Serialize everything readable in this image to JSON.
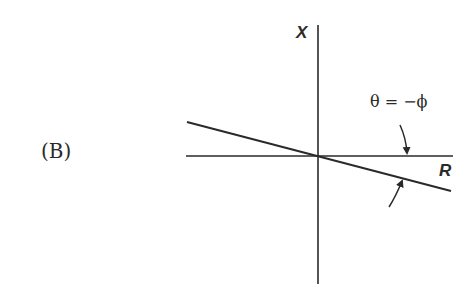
{
  "panel": {
    "label": "(B)"
  },
  "axes": {
    "vertical_label": "X",
    "horizontal_label": "R"
  },
  "annotation": {
    "equation": "θ = −ϕ"
  },
  "colors": {
    "line": "#2a2a2a",
    "background": "#ffffff"
  }
}
